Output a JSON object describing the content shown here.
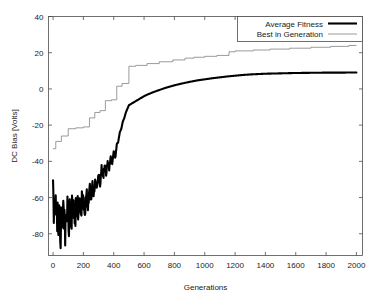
{
  "chart_data": {
    "type": "line",
    "title": "",
    "xlabel": "Generations",
    "ylabel": "DC Bias [Volts]",
    "xlim": [
      -30,
      2040
    ],
    "ylim": [
      -92,
      40
    ],
    "grid": false,
    "legend_position": "top-right",
    "xticks": [
      0,
      200,
      400,
      600,
      800,
      1000,
      1200,
      1400,
      1600,
      1800,
      2000
    ],
    "xtick_labels": [
      "0",
      "200",
      "400",
      "600",
      "800",
      "1000",
      "1200",
      "1400",
      "1600",
      "1800",
      "2000"
    ],
    "yticks": [
      40,
      20,
      0,
      -20,
      -40,
      -60,
      -80
    ],
    "ytick_labels": [
      "40",
      "20",
      "0",
      "-20",
      "-40",
      "-60",
      "-80"
    ],
    "series": [
      {
        "name": "Average Fitness",
        "style": "thick-black",
        "color": "#000000",
        "x": [
          0,
          5,
          10,
          15,
          20,
          25,
          30,
          35,
          40,
          45,
          50,
          55,
          60,
          65,
          70,
          75,
          80,
          85,
          90,
          95,
          100,
          105,
          110,
          115,
          120,
          125,
          130,
          135,
          140,
          145,
          150,
          155,
          160,
          165,
          170,
          175,
          180,
          185,
          190,
          195,
          200,
          210,
          220,
          230,
          240,
          250,
          260,
          270,
          280,
          290,
          300,
          310,
          320,
          330,
          340,
          350,
          360,
          370,
          380,
          390,
          400,
          410,
          420,
          430,
          440,
          450,
          460,
          470,
          480,
          490,
          500,
          520,
          540,
          560,
          580,
          600,
          620,
          640,
          660,
          680,
          700,
          750,
          800,
          850,
          900,
          950,
          1000,
          1050,
          1100,
          1150,
          1200,
          1250,
          1300,
          1400,
          1500,
          1600,
          1700,
          1800,
          1900,
          2000
        ],
        "y": [
          -59,
          -66,
          -63,
          -71,
          -62,
          -74,
          -66,
          -78,
          -63,
          -71,
          -84,
          -68,
          -76,
          -63,
          -72,
          -67,
          -80,
          -64,
          -73,
          -62,
          -70,
          -76,
          -61,
          -69,
          -78,
          -64,
          -71,
          -60,
          -68,
          -77,
          -63,
          -70,
          -62,
          -67,
          -72,
          -61,
          -66,
          -70,
          -60,
          -64,
          -62,
          -68,
          -58,
          -64,
          -55,
          -60,
          -52,
          -58,
          -49,
          -55,
          -47,
          -52,
          -44,
          -50,
          -42,
          -47,
          -40,
          -44,
          -37,
          -42,
          -35,
          -38,
          -31,
          -29,
          -24,
          -22,
          -18,
          -16,
          -13,
          -11,
          -9,
          -8,
          -7,
          -6,
          -5,
          -4,
          -3.2,
          -2.5,
          -1.8,
          -1.2,
          -0.6,
          0.8,
          2.0,
          3.0,
          3.9,
          4.7,
          5.3,
          5.9,
          6.4,
          6.9,
          7.3,
          7.7,
          8.0,
          8.4,
          8.6,
          8.8,
          8.9,
          9.0,
          9.0,
          9.1
        ]
      },
      {
        "name": "Best in Generation",
        "style": "thin-gray",
        "color": "#7a7a7a",
        "step": true,
        "x": [
          0,
          18,
          18,
          55,
          55,
          100,
          100,
          150,
          150,
          200,
          200,
          240,
          240,
          275,
          275,
          310,
          310,
          345,
          345,
          385,
          385,
          420,
          420,
          455,
          455,
          500,
          500,
          545,
          545,
          620,
          620,
          700,
          700,
          790,
          790,
          870,
          870,
          930,
          930,
          1000,
          1000,
          1080,
          1080,
          1160,
          1160,
          1200,
          1200,
          1320,
          1320,
          1430,
          1430,
          1560,
          1560,
          1700,
          1700,
          1830,
          1830,
          1950,
          1950,
          2000
        ],
        "y": [
          -33,
          -33,
          -29,
          -29,
          -26,
          -26,
          -22,
          -22,
          -21.5,
          -21.5,
          -21,
          -21,
          -16,
          -16,
          -13,
          -13,
          -12,
          -12,
          -6.5,
          -6.5,
          -6,
          -6,
          1.5,
          1.5,
          3,
          3,
          12.5,
          12.5,
          13,
          13,
          14,
          14,
          15,
          15,
          16,
          16,
          17,
          17,
          17.5,
          17.5,
          18,
          18,
          18.5,
          18.5,
          20.5,
          20.5,
          21,
          21,
          21.5,
          21.5,
          22,
          22,
          22.5,
          22.5,
          23,
          23,
          23.5,
          23.5,
          24,
          24
        ]
      }
    ]
  },
  "legend": {
    "entries": [
      {
        "label": "Average Fitness",
        "swatch": "thick-black-line"
      },
      {
        "label": "Best in Generation",
        "swatch": "thin-gray-line"
      }
    ]
  }
}
